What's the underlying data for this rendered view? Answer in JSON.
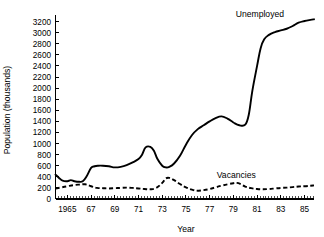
{
  "chart_data": {
    "type": "line",
    "title": "",
    "xlabel": "Year",
    "ylabel": "Population (thousands)",
    "xlim": [
      1964.0,
      1985.8
    ],
    "ylim": [
      0,
      3300
    ],
    "y_ticks": [
      0,
      200,
      400,
      600,
      800,
      1000,
      1200,
      1400,
      1600,
      1800,
      2000,
      2200,
      2400,
      2600,
      2800,
      3000,
      3200
    ],
    "y_tick_labels": [
      "0",
      "200",
      "400",
      "600",
      "800",
      "1000",
      "1200",
      "1400",
      "1600",
      "1800",
      "2000",
      "2200",
      "2400",
      "2600",
      "2800",
      "3000",
      "3200"
    ],
    "x_ticks": [
      1965,
      1967,
      1969,
      1971,
      1973,
      1975,
      1977,
      1979,
      1981,
      1983,
      1985
    ],
    "x_tick_labels": [
      "1965",
      "67",
      "69",
      "71",
      "73",
      "75",
      "77",
      "79",
      "81",
      "83",
      "85"
    ],
    "x_minor_tick_interval": 0.25,
    "grid": false,
    "legend_position": "inline-annotation",
    "line_color": "#000000",
    "background": "#ffffff",
    "series": [
      {
        "name": "Unemployed",
        "style": "solid",
        "label_x": 1979.2,
        "label_y": 3330,
        "x": [
          1964.0,
          1964.3,
          1964.6,
          1965.0,
          1965.3,
          1965.6,
          1966.0,
          1966.3,
          1966.6,
          1967.0,
          1967.3,
          1967.6,
          1968.0,
          1968.5,
          1969.0,
          1969.5,
          1970.0,
          1970.5,
          1971.0,
          1971.3,
          1971.6,
          1972.0,
          1972.3,
          1972.6,
          1973.0,
          1973.3,
          1973.6,
          1974.0,
          1974.5,
          1975.0,
          1975.5,
          1976.0,
          1976.5,
          1977.0,
          1977.5,
          1978.0,
          1978.5,
          1979.0,
          1979.5,
          1980.0,
          1980.3,
          1980.6,
          1981.0,
          1981.3,
          1981.6,
          1982.0,
          1982.5,
          1983.0,
          1983.5,
          1984.0,
          1984.5,
          1985.0,
          1985.5,
          1985.8
        ],
        "y": [
          440,
          380,
          330,
          320,
          340,
          320,
          310,
          320,
          400,
          560,
          590,
          600,
          600,
          590,
          570,
          580,
          610,
          660,
          720,
          800,
          930,
          940,
          870,
          720,
          600,
          570,
          580,
          640,
          780,
          980,
          1150,
          1260,
          1330,
          1400,
          1460,
          1490,
          1450,
          1380,
          1330,
          1340,
          1520,
          1950,
          2400,
          2720,
          2880,
          2960,
          3010,
          3040,
          3070,
          3120,
          3180,
          3210,
          3230,
          3240
        ]
      },
      {
        "name": "Vacancies",
        "style": "dashed",
        "label_x": 1977.6,
        "label_y": 430,
        "x": [
          1964.0,
          1964.5,
          1965.0,
          1965.5,
          1966.0,
          1966.5,
          1967.0,
          1967.5,
          1968.0,
          1968.5,
          1969.0,
          1969.5,
          1970.0,
          1970.5,
          1971.0,
          1971.5,
          1972.0,
          1972.5,
          1973.0,
          1973.3,
          1973.6,
          1974.0,
          1974.5,
          1975.0,
          1975.5,
          1976.0,
          1976.5,
          1977.0,
          1977.5,
          1978.0,
          1978.5,
          1979.0,
          1979.3,
          1979.6,
          1980.0,
          1980.5,
          1981.0,
          1981.5,
          1982.0,
          1982.5,
          1983.0,
          1983.5,
          1984.0,
          1984.5,
          1985.0,
          1985.5,
          1985.8
        ],
        "y": [
          190,
          210,
          230,
          250,
          260,
          265,
          230,
          200,
          195,
          190,
          195,
          200,
          205,
          200,
          190,
          180,
          175,
          200,
          290,
          370,
          380,
          340,
          270,
          210,
          170,
          150,
          160,
          180,
          210,
          240,
          265,
          285,
          290,
          270,
          225,
          195,
          180,
          175,
          180,
          190,
          200,
          205,
          215,
          225,
          230,
          240,
          245
        ]
      }
    ]
  }
}
